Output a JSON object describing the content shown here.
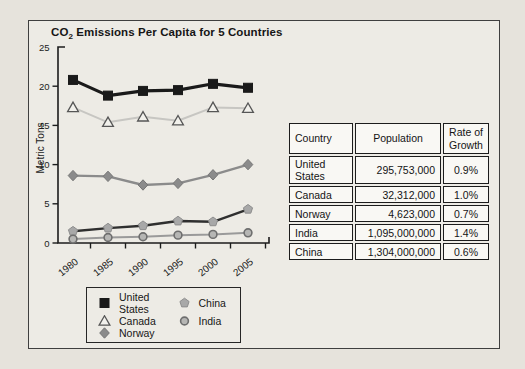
{
  "chart": {
    "title": {
      "prefix": "CO",
      "sub": "2",
      "rest": " Emissions Per Capita for 5 Countries"
    },
    "y_axis_label": "Metric Tons"
  },
  "chart_data": {
    "type": "line",
    "title": "CO2 Emissions Per Capita for 5 Countries",
    "xlabel": "",
    "ylabel": "Metric Tons",
    "ylim": [
      0,
      25
    ],
    "y_ticks": [
      0,
      5,
      10,
      15,
      20,
      25
    ],
    "grid": false,
    "legend_position": "bottom-left",
    "categories": [
      "1980",
      "1985",
      "1990",
      "1995",
      "2000",
      "2005"
    ],
    "series": [
      {
        "name": "United States",
        "marker": "square",
        "line_color": "#1a1a1a",
        "line_width": 3.2,
        "marker_fill": "#1a1a1a",
        "marker_stroke": "#1a1a1a",
        "values": [
          20.8,
          18.8,
          19.4,
          19.5,
          20.3,
          19.8
        ]
      },
      {
        "name": "Canada",
        "marker": "triangle-open",
        "line_color": "#c7c6c2",
        "line_width": 2.0,
        "marker_fill": "#f2f1ec",
        "marker_stroke": "#565656",
        "values": [
          17.3,
          15.4,
          16.1,
          15.6,
          17.3,
          17.2
        ]
      },
      {
        "name": "Norway",
        "marker": "diamond",
        "line_color": "#8b8b8b",
        "line_width": 2.4,
        "marker_fill": "#8b8b8b",
        "marker_stroke": "#757575",
        "values": [
          8.6,
          8.5,
          7.4,
          7.6,
          8.7,
          10.0
        ]
      },
      {
        "name": "China",
        "marker": "pentagon",
        "line_color": "#2f2f2f",
        "line_width": 2.4,
        "marker_fill": "#a8a8a8",
        "marker_stroke": "#8d8d8d",
        "values": [
          1.5,
          1.9,
          2.2,
          2.8,
          2.7,
          4.3
        ]
      },
      {
        "name": "India",
        "marker": "circle",
        "line_color": "#9a9a9a",
        "line_width": 2.0,
        "marker_fill": "#b6b6b4",
        "marker_stroke": "#6e6e6e",
        "values": [
          0.5,
          0.7,
          0.8,
          1.0,
          1.1,
          1.3
        ]
      }
    ]
  },
  "table": {
    "headers": [
      "Country",
      "Population",
      "Rate of Growth"
    ],
    "rows": [
      {
        "country": "United States",
        "population": "295,753,000",
        "rate": "0.9%"
      },
      {
        "country": "Canada",
        "population": "32,312,000",
        "rate": "1.0%"
      },
      {
        "country": "Norway",
        "population": "4,623,000",
        "rate": "0.7%"
      },
      {
        "country": "India",
        "population": "1,095,000,000",
        "rate": "1.4%"
      },
      {
        "country": "China",
        "population": "1,304,000,000",
        "rate": "0.6%"
      }
    ]
  },
  "legend": {
    "items": [
      {
        "label": "United States",
        "marker": "square"
      },
      {
        "label": "Canada",
        "marker": "triangle-open"
      },
      {
        "label": "Norway",
        "marker": "diamond"
      },
      {
        "label": "China",
        "marker": "pentagon"
      },
      {
        "label": "India",
        "marker": "circle"
      }
    ]
  }
}
